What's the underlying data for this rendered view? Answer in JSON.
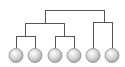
{
  "diagram": {
    "type": "dendrogram",
    "line_color": "#555555",
    "leaf_fill_light": "#ffffff",
    "leaf_fill_dark": "#a8a8a8",
    "leaf_stroke": "#8a8a8a",
    "leaves": [
      {
        "id": "leaf-1",
        "cx": 16
      },
      {
        "id": "leaf-2",
        "cx": 35
      },
      {
        "id": "leaf-3",
        "cx": 55
      },
      {
        "id": "leaf-4",
        "cx": 74
      },
      {
        "id": "leaf-5",
        "cx": 93
      },
      {
        "id": "leaf-6",
        "cx": 112
      }
    ]
  }
}
